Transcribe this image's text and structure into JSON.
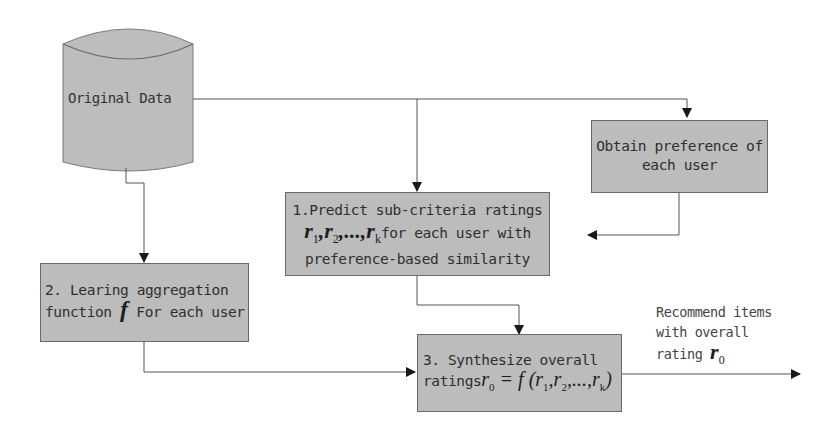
{
  "diagram": {
    "type": "flowchart",
    "nodes": {
      "original_data": {
        "label": "Original Data",
        "shape": "cylinder"
      },
      "obtain_preference": {
        "line1": "Obtain preference of",
        "line2": "each user"
      },
      "predict": {
        "line1": "1.Predict sub-criteria ratings",
        "math": "r1, r2, ..., rk",
        "line2_suffix": "for each user with",
        "line3": "preference-based similarity"
      },
      "learn": {
        "line1": "2. Learing aggregation",
        "line2_prefix": "function",
        "math": "f",
        "line2_suffix": "For each user"
      },
      "synthesize": {
        "line1": "3. Synthesize overall",
        "line2_prefix": "ratings",
        "math": "r0 = f(r1, r2, ..., rk)"
      }
    },
    "output_label": {
      "line1": "Recommend items",
      "line2": "with overall",
      "line3_prefix": "rating",
      "math": "r0"
    },
    "edges": [
      {
        "from": "original_data",
        "to": "obtain_preference"
      },
      {
        "from": "original_data",
        "to": "predict"
      },
      {
        "from": "obtain_preference",
        "to": "predict"
      },
      {
        "from": "original_data",
        "to": "learn"
      },
      {
        "from": "predict",
        "to": "synthesize"
      },
      {
        "from": "learn",
        "to": "synthesize"
      },
      {
        "from": "synthesize",
        "to": "output"
      }
    ],
    "colors": {
      "box_fill": "#bcbcbc",
      "box_border": "#6a6a6a",
      "line": "#555555",
      "arrow": "#1a1a1a"
    }
  }
}
